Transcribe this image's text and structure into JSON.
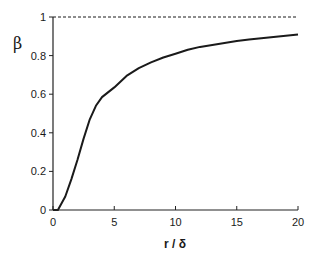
{
  "chart_data": {
    "type": "line",
    "title": "",
    "xlabel": "r / δ",
    "ylabel": "β",
    "xlim": [
      0,
      20
    ],
    "ylim": [
      0,
      1
    ],
    "xticks": [
      0,
      5,
      10,
      15,
      20
    ],
    "xtick_labels": [
      "0",
      "5",
      "10",
      "15",
      "20"
    ],
    "yticks": [
      0,
      0.2,
      0.4,
      0.6,
      0.8,
      1
    ],
    "ytick_labels": [
      "0",
      "0.2",
      "0.4",
      "0.6",
      "0.8",
      "1"
    ],
    "grid": false,
    "legend": null,
    "series": [
      {
        "name": "β(r/δ)",
        "style": "solid",
        "color": "#1a1a1a",
        "x": [
          0,
          0.4,
          1,
          1.5,
          2,
          2.5,
          3,
          3.5,
          4,
          5,
          6,
          7,
          8,
          9,
          10,
          11,
          12,
          13,
          14,
          15,
          16,
          17,
          18,
          19,
          20
        ],
        "y": [
          0,
          0.0,
          0.07,
          0.16,
          0.26,
          0.37,
          0.47,
          0.54,
          0.585,
          0.635,
          0.695,
          0.735,
          0.765,
          0.79,
          0.81,
          0.83,
          0.845,
          0.855,
          0.865,
          0.875,
          0.883,
          0.89,
          0.897,
          0.903,
          0.91
        ]
      },
      {
        "name": "asymptote β=1",
        "style": "dashed",
        "color": "#1a1a1a",
        "x": [
          0,
          20
        ],
        "y": [
          1,
          1
        ]
      }
    ]
  }
}
